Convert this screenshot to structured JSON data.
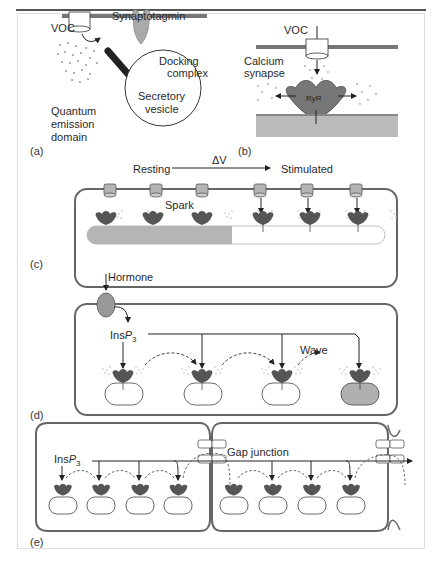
{
  "figure": {
    "panel_labels": [
      "(a)",
      "(b)",
      "(c)",
      "(d)",
      "(e)"
    ],
    "panel_a": {
      "voc": "VOC",
      "synaptotagmin": "Synaptotagmin",
      "docking_line1": "Docking",
      "docking_line2": "complex",
      "vesicle_line1": "Secretory",
      "vesicle_line2": "vesicle",
      "qed_line1": "Quantum",
      "qed_line2": "emission",
      "qed_line3": "domain"
    },
    "panel_b": {
      "voc": "VOC",
      "calcium_line1": "Calcium",
      "calcium_line2": "synapse",
      "ryr": "RyR"
    },
    "panel_c": {
      "resting": "Resting",
      "delta_v": "ΔV",
      "stimulated": "Stimulated",
      "spark": "Spark"
    },
    "panel_d": {
      "hormone": "Hormone",
      "insp3_prefix": "Ins",
      "insp3_p": "P",
      "insp3_sub": "3",
      "wave": "Wave"
    },
    "panel_e": {
      "insp3_prefix": "Ins",
      "insp3_p": "P",
      "insp3_sub": "3",
      "gap_junction": "Gap junction"
    }
  },
  "colors": {
    "membrane": "#777777",
    "receptor": "#555555",
    "fill_gray": "#b5b5b5",
    "light_gray": "#cccccc"
  }
}
